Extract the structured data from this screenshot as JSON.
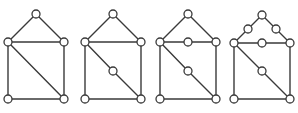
{
  "diagram": {
    "type": "graph-subdivisions",
    "colors": {
      "edge": "#3a3a3a",
      "vertex_fill": "#ffffff",
      "vertex_stroke": "#3a3a3a",
      "background": "#ffffff"
    },
    "vertex_radius": 4,
    "graphs": [
      {
        "id": "graph-1",
        "vertices": [
          [
            36,
            14
          ],
          [
            8,
            42
          ],
          [
            64,
            42
          ],
          [
            8,
            99
          ],
          [
            64,
            99
          ]
        ],
        "edges": [
          [
            0,
            1
          ],
          [
            0,
            2
          ],
          [
            1,
            2
          ],
          [
            1,
            3
          ],
          [
            2,
            4
          ],
          [
            3,
            4
          ],
          [
            1,
            4
          ]
        ]
      },
      {
        "id": "graph-2",
        "vertices": [
          [
            113,
            14
          ],
          [
            85,
            42
          ],
          [
            141,
            42
          ],
          [
            85,
            99
          ],
          [
            141,
            99
          ],
          [
            113,
            71
          ]
        ],
        "edges": [
          [
            0,
            1
          ],
          [
            0,
            2
          ],
          [
            1,
            2
          ],
          [
            1,
            3
          ],
          [
            2,
            4
          ],
          [
            3,
            4
          ],
          [
            1,
            5
          ],
          [
            5,
            4
          ]
        ]
      },
      {
        "id": "graph-3",
        "vertices": [
          [
            188,
            14
          ],
          [
            160,
            42
          ],
          [
            216,
            42
          ],
          [
            160,
            99
          ],
          [
            216,
            99
          ],
          [
            188,
            71
          ],
          [
            188,
            42
          ]
        ],
        "edges": [
          [
            0,
            1
          ],
          [
            0,
            2
          ],
          [
            1,
            6
          ],
          [
            6,
            2
          ],
          [
            1,
            3
          ],
          [
            2,
            4
          ],
          [
            3,
            4
          ],
          [
            1,
            5
          ],
          [
            5,
            4
          ]
        ]
      },
      {
        "id": "graph-4",
        "vertices": [
          [
            262,
            15
          ],
          [
            234,
            43
          ],
          [
            290,
            43
          ],
          [
            234,
            99
          ],
          [
            290,
            99
          ],
          [
            262,
            71
          ],
          [
            262,
            43
          ],
          [
            248,
            29
          ],
          [
            276,
            29
          ]
        ],
        "edges": [
          [
            0,
            7
          ],
          [
            7,
            1
          ],
          [
            0,
            8
          ],
          [
            8,
            2
          ],
          [
            1,
            6
          ],
          [
            6,
            2
          ],
          [
            1,
            3
          ],
          [
            2,
            4
          ],
          [
            3,
            4
          ],
          [
            1,
            5
          ],
          [
            5,
            4
          ]
        ]
      }
    ]
  }
}
